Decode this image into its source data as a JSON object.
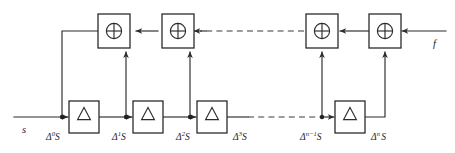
{
  "diagram": {
    "type": "block-diagram",
    "background_color": "#ffffff",
    "line_color": "#2b2b2b",
    "io": {
      "input_label": "s",
      "feedback_label": "f"
    },
    "xor_symbol": "⊕",
    "delta_symbol": "△",
    "xor_gates": [
      {
        "id": "xor-1",
        "symbol": "⊕"
      },
      {
        "id": "xor-2",
        "symbol": "⊕"
      },
      {
        "id": "xor-3",
        "symbol": "⊕"
      },
      {
        "id": "xor-4",
        "symbol": "⊕"
      }
    ],
    "delta_blocks": [
      {
        "id": "delta-1",
        "symbol": "△"
      },
      {
        "id": "delta-2",
        "symbol": "△"
      },
      {
        "id": "delta-3",
        "symbol": "△"
      },
      {
        "id": "delta-4",
        "symbol": "△"
      }
    ],
    "tap_labels": [
      {
        "id": "tap-0",
        "base": "Δ",
        "sup": "0",
        "signal": "S"
      },
      {
        "id": "tap-1",
        "base": "Δ",
        "sup": "1",
        "signal": "S"
      },
      {
        "id": "tap-2",
        "base": "Δ",
        "sup": "2",
        "signal": "S"
      },
      {
        "id": "tap-3",
        "base": "Δ",
        "sup": "3",
        "signal": "S"
      },
      {
        "id": "tap-n-minus-1",
        "base": "Δ",
        "sup": "n−1",
        "signal": "S"
      },
      {
        "id": "tap-n",
        "base": "Δ",
        "sup": "n",
        "signal": "S"
      }
    ],
    "ellipsis": {
      "top_dashed": true,
      "bottom_dashed": true
    }
  }
}
